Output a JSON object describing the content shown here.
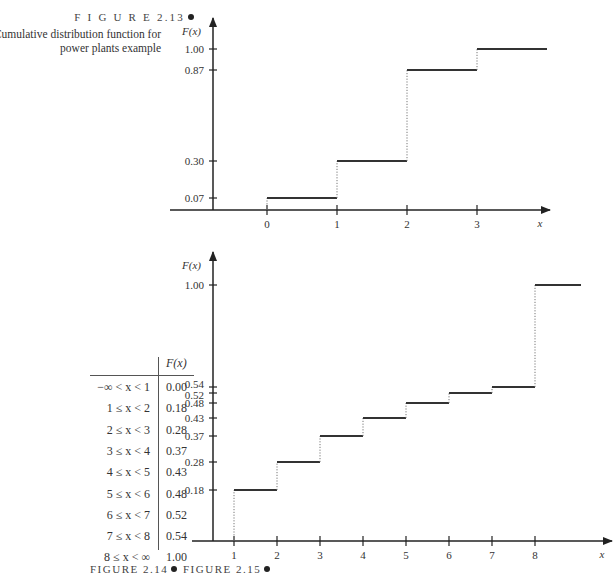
{
  "figure_2_13": {
    "label": "F I G U R E  2.13",
    "caption_line1": "Cumulative distribution function for",
    "caption_line2": "power plants example"
  },
  "figure_2_14": {
    "label": "FIGURE 2.14"
  },
  "figure_2_15": {
    "label": "FIGURE 2.15"
  },
  "table": {
    "header": "F(x)",
    "rows": [
      {
        "range": "−∞ < x < 1",
        "value": "0.00"
      },
      {
        "range": "1 ≤ x < 2",
        "value": "0.18"
      },
      {
        "range": "2 ≤ x < 3",
        "value": "0.28"
      },
      {
        "range": "3 ≤ x < 4",
        "value": "0.37"
      },
      {
        "range": "4 ≤ x < 5",
        "value": "0.43"
      },
      {
        "range": "5 ≤ x < 6",
        "value": "0.48"
      },
      {
        "range": "6 ≤ x < 7",
        "value": "0.52"
      },
      {
        "range": "7 ≤ x < 8",
        "value": "0.54"
      },
      {
        "range": "8 ≤ x < ∞",
        "value": "1.00"
      }
    ]
  },
  "chart_data": [
    {
      "type": "line",
      "subtype": "step",
      "title": "Cumulative distribution function for power plants example",
      "xlabel": "x",
      "ylabel": "F(x)",
      "x_ticks": [
        "0",
        "1",
        "2",
        "3"
      ],
      "y_ticks": [
        "0.07",
        "0.30",
        "0.87",
        "1.00"
      ],
      "steps": [
        {
          "x_start": 0,
          "x_end": 1,
          "y": 0.07
        },
        {
          "x_start": 1,
          "x_end": 2,
          "y": 0.3
        },
        {
          "x_start": 2,
          "x_end": 3,
          "y": 0.87
        },
        {
          "x_start": 3,
          "x_end": 4,
          "y": 1.0
        }
      ],
      "grid": false
    },
    {
      "type": "line",
      "subtype": "step",
      "title": "",
      "xlabel": "x",
      "ylabel": "F(x)",
      "x_ticks": [
        "1",
        "2",
        "3",
        "4",
        "5",
        "6",
        "7",
        "8"
      ],
      "y_ticks": [
        "0.18",
        "0.28",
        "0.37",
        "0.43",
        "0.48",
        "0.52",
        "0.54",
        "1.00"
      ],
      "steps": [
        {
          "x_start": 1,
          "x_end": 2,
          "y": 0.18
        },
        {
          "x_start": 2,
          "x_end": 3,
          "y": 0.28
        },
        {
          "x_start": 3,
          "x_end": 4,
          "y": 0.37
        },
        {
          "x_start": 4,
          "x_end": 5,
          "y": 0.43
        },
        {
          "x_start": 5,
          "x_end": 6,
          "y": 0.48
        },
        {
          "x_start": 6,
          "x_end": 7,
          "y": 0.52
        },
        {
          "x_start": 7,
          "x_end": 8,
          "y": 0.54
        },
        {
          "x_start": 8,
          "x_end": 9,
          "y": 1.0
        }
      ],
      "grid": false
    }
  ]
}
